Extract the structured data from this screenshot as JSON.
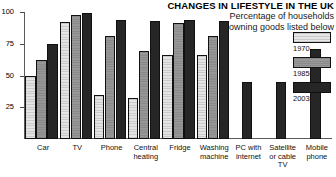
{
  "chart_data": {
    "type": "bar",
    "title": "CHANGES IN LIFESTYLE IN THE UK",
    "subtitle_line1": "Percentage of households",
    "subtitle_line2": "owning goods listed below",
    "xlabel": "",
    "ylabel": "",
    "ylim": [
      0,
      100
    ],
    "yticks": [
      25,
      50,
      75,
      100
    ],
    "grid": false,
    "legend_position": "right",
    "categories": [
      "Car",
      "TV",
      "Phone",
      "Central heating",
      "Fridge",
      "Washing machine",
      "PC with internet",
      "Satellite or cable TV",
      "Mobile phone"
    ],
    "category_lines": [
      [
        "Car"
      ],
      [
        "TV"
      ],
      [
        "Phone"
      ],
      [
        "Central",
        "heating"
      ],
      [
        "Fridge"
      ],
      [
        "Washing",
        "machine"
      ],
      [
        "PC with",
        "internet"
      ],
      [
        "Satellite",
        "or cable",
        "TV"
      ],
      [
        "Mobile",
        "phone"
      ]
    ],
    "series": [
      {
        "name": "1970",
        "color": "#d4d4d4",
        "values": [
          50,
          92,
          35,
          32,
          66,
          66,
          null,
          null,
          null
        ]
      },
      {
        "name": "1985",
        "color": "#8e8e8e",
        "values": [
          62,
          98,
          81,
          69,
          91,
          81,
          null,
          null,
          null
        ]
      },
      {
        "name": "2003",
        "color": "#262626",
        "values": [
          75,
          99,
          94,
          93,
          94,
          93,
          45,
          45,
          71
        ]
      }
    ]
  },
  "legend": {
    "items": [
      {
        "label": "1970",
        "swatch": "light-hatched-swatch"
      },
      {
        "label": "1985",
        "swatch": "gray-hatched-swatch"
      },
      {
        "label": "2003",
        "swatch": "dark-solid-swatch"
      }
    ]
  }
}
